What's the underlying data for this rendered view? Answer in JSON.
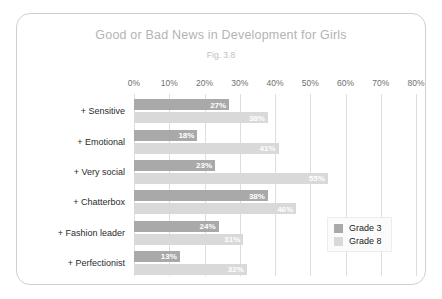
{
  "chart_data": {
    "type": "bar",
    "orientation": "horizontal",
    "title": "Good or Bad News in Development for Girls",
    "subtitle": "Fig. 3.8",
    "xlabel": "",
    "ylabel": "",
    "xlim": [
      0,
      80
    ],
    "xtick_labels": [
      "0%",
      "10%",
      "20%",
      "30%",
      "40%",
      "50%",
      "60%",
      "70%",
      "80%"
    ],
    "xtick_values": [
      0,
      10,
      20,
      30,
      40,
      50,
      60,
      70,
      80
    ],
    "grid": true,
    "legend_position": "center-right",
    "categories": [
      "+ Sensitive",
      "+ Emotional",
      "+ Very social",
      "+ Chatterbox",
      "+ Fashion leader",
      "+ Perfectionist"
    ],
    "series": [
      {
        "name": "Grade 3",
        "color": "#a9a9a9",
        "values": [
          27,
          18,
          23,
          38,
          24,
          13
        ],
        "labels": [
          "27%",
          "18%",
          "23%",
          "38%",
          "24%",
          "13%"
        ]
      },
      {
        "name": "Grade 8",
        "color": "#d9d9d9",
        "values": [
          38,
          41,
          55,
          46,
          31,
          32
        ],
        "labels": [
          "38%",
          "41%",
          "55%",
          "46%",
          "31%",
          "32%"
        ]
      }
    ]
  },
  "legend": {
    "items": [
      {
        "label": "Grade 3",
        "color": "#a9a9a9"
      },
      {
        "label": "Grade 8",
        "color": "#d9d9d9"
      }
    ]
  }
}
